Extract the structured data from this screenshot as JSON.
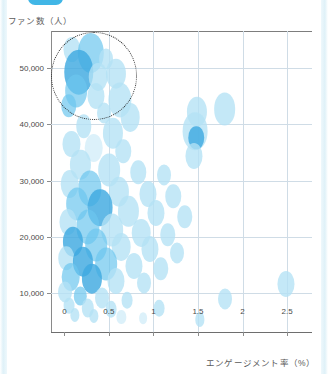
{
  "page": {
    "background_color": "#ffffff",
    "edge_strip_color": "#dff1f8"
  },
  "top_badge": {
    "name": "tab-pill",
    "color": "#41b6e6"
  },
  "chart_data": {
    "type": "scatter",
    "title": "",
    "xlabel": "エンゲージメント率（%）",
    "ylabel": "ファン数（人）",
    "xlim": [
      -0.15,
      2.78
    ],
    "ylim": [
      3000,
      56500
    ],
    "xticks": [
      0,
      0.5,
      1,
      1.5,
      2,
      2.5
    ],
    "xticklabels": [
      "0",
      "0.5",
      "1",
      "1.5",
      "2",
      "2.5"
    ],
    "yticks": [
      10000,
      20000,
      30000,
      40000,
      50000
    ],
    "yticklabels": [
      "10,000",
      "20,000",
      "30,000",
      "40,000",
      "50,000"
    ],
    "grid": true,
    "legend": "none",
    "marker_shape": "vertical-ellipse",
    "colors": {
      "bubble_dark": "#3fa9e0",
      "bubble_mid": "#6cc6ee",
      "bubble_light": "#b3e2f5",
      "bubble_pale": "#d6eef9",
      "grid": "#cfdce6",
      "axis": "#8c8c8c",
      "annotation": "#2b2b2b"
    },
    "annotations": [
      {
        "type": "dotted-ellipse",
        "label": "top-left cluster highlight",
        "center_x": 0.33,
        "center_y": 48500,
        "width_x": 0.96,
        "height_y": 15500
      }
    ],
    "points": [
      {
        "x": 0.09,
        "y": 53200,
        "r": 11,
        "shade": "light"
      },
      {
        "x": 0.3,
        "y": 52600,
        "r": 17,
        "shade": "mid"
      },
      {
        "x": 0.47,
        "y": 51600,
        "r": 9,
        "shade": "light"
      },
      {
        "x": 0.16,
        "y": 49200,
        "r": 19,
        "shade": "dark"
      },
      {
        "x": 0.38,
        "y": 48400,
        "r": 12,
        "shade": "light"
      },
      {
        "x": 0.58,
        "y": 48900,
        "r": 13,
        "shade": "light"
      },
      {
        "x": 0.13,
        "y": 45800,
        "r": 14,
        "shade": "mid"
      },
      {
        "x": 0.35,
        "y": 45000,
        "r": 11,
        "shade": "light"
      },
      {
        "x": 0.62,
        "y": 44300,
        "r": 15,
        "shade": "light"
      },
      {
        "x": 0.05,
        "y": 43300,
        "r": 10,
        "shade": "mid"
      },
      {
        "x": 0.45,
        "y": 42000,
        "r": 9,
        "shade": "light"
      },
      {
        "x": 0.74,
        "y": 41200,
        "r": 12,
        "shade": "light"
      },
      {
        "x": 1.49,
        "y": 42200,
        "r": 13,
        "shade": "light"
      },
      {
        "x": 1.8,
        "y": 42600,
        "r": 14,
        "shade": "light"
      },
      {
        "x": 0.22,
        "y": 39600,
        "r": 10,
        "shade": "light"
      },
      {
        "x": 0.55,
        "y": 38400,
        "r": 13,
        "shade": "light"
      },
      {
        "x": 1.47,
        "y": 38800,
        "r": 16,
        "shade": "light"
      },
      {
        "x": 1.48,
        "y": 37600,
        "r": 10,
        "shade": "dark"
      },
      {
        "x": 0.08,
        "y": 36400,
        "r": 11,
        "shade": "light"
      },
      {
        "x": 0.33,
        "y": 35800,
        "r": 12,
        "shade": "pale"
      },
      {
        "x": 0.66,
        "y": 35200,
        "r": 10,
        "shade": "light"
      },
      {
        "x": 1.46,
        "y": 34400,
        "r": 11,
        "shade": "light"
      },
      {
        "x": 0.18,
        "y": 32800,
        "r": 13,
        "shade": "light"
      },
      {
        "x": 0.5,
        "y": 31800,
        "r": 14,
        "shade": "light"
      },
      {
        "x": 0.83,
        "y": 31500,
        "r": 10,
        "shade": "light"
      },
      {
        "x": 1.12,
        "y": 31000,
        "r": 9,
        "shade": "light"
      },
      {
        "x": 0.06,
        "y": 29400,
        "r": 12,
        "shade": "light"
      },
      {
        "x": 0.29,
        "y": 28600,
        "r": 15,
        "shade": "mid"
      },
      {
        "x": 0.61,
        "y": 28000,
        "r": 13,
        "shade": "light"
      },
      {
        "x": 0.94,
        "y": 27600,
        "r": 11,
        "shade": "light"
      },
      {
        "x": 1.22,
        "y": 27200,
        "r": 10,
        "shade": "light"
      },
      {
        "x": 0.14,
        "y": 25800,
        "r": 14,
        "shade": "mid"
      },
      {
        "x": 0.4,
        "y": 25200,
        "r": 16,
        "shade": "dark"
      },
      {
        "x": 0.72,
        "y": 24600,
        "r": 13,
        "shade": "light"
      },
      {
        "x": 1.03,
        "y": 24200,
        "r": 11,
        "shade": "light"
      },
      {
        "x": 1.35,
        "y": 23600,
        "r": 10,
        "shade": "light"
      },
      {
        "x": 0.04,
        "y": 22600,
        "r": 11,
        "shade": "light"
      },
      {
        "x": 0.26,
        "y": 21800,
        "r": 15,
        "shade": "mid"
      },
      {
        "x": 0.54,
        "y": 21200,
        "r": 14,
        "shade": "light"
      },
      {
        "x": 0.86,
        "y": 20800,
        "r": 12,
        "shade": "light"
      },
      {
        "x": 1.16,
        "y": 20400,
        "r": 10,
        "shade": "light"
      },
      {
        "x": 0.1,
        "y": 19200,
        "r": 13,
        "shade": "dark"
      },
      {
        "x": 0.36,
        "y": 18600,
        "r": 14,
        "shade": "mid"
      },
      {
        "x": 0.64,
        "y": 18200,
        "r": 12,
        "shade": "light"
      },
      {
        "x": 0.96,
        "y": 17800,
        "r": 11,
        "shade": "light"
      },
      {
        "x": 1.26,
        "y": 17200,
        "r": 9,
        "shade": "light"
      },
      {
        "x": 0.02,
        "y": 16200,
        "r": 10,
        "shade": "light"
      },
      {
        "x": 0.21,
        "y": 15600,
        "r": 13,
        "shade": "dark"
      },
      {
        "x": 0.47,
        "y": 15200,
        "r": 14,
        "shade": "mid"
      },
      {
        "x": 0.78,
        "y": 14800,
        "r": 11,
        "shade": "light"
      },
      {
        "x": 1.08,
        "y": 14400,
        "r": 10,
        "shade": "light"
      },
      {
        "x": 0.07,
        "y": 13000,
        "r": 12,
        "shade": "mid"
      },
      {
        "x": 0.31,
        "y": 12600,
        "r": 13,
        "shade": "dark"
      },
      {
        "x": 0.58,
        "y": 12200,
        "r": 11,
        "shade": "light"
      },
      {
        "x": 0.89,
        "y": 11800,
        "r": 9,
        "shade": "light"
      },
      {
        "x": 2.49,
        "y": 11600,
        "r": 11,
        "shade": "light"
      },
      {
        "x": 0.01,
        "y": 10200,
        "r": 9,
        "shade": "light"
      },
      {
        "x": 0.18,
        "y": 9600,
        "r": 8,
        "shade": "mid"
      },
      {
        "x": 0.42,
        "y": 9200,
        "r": 9,
        "shade": "light"
      },
      {
        "x": 0.7,
        "y": 8800,
        "r": 7,
        "shade": "light"
      },
      {
        "x": 1.8,
        "y": 9000,
        "r": 9,
        "shade": "light"
      },
      {
        "x": 0.05,
        "y": 7800,
        "r": 7,
        "shade": "light"
      },
      {
        "x": 0.26,
        "y": 7400,
        "r": 8,
        "shade": "light"
      },
      {
        "x": 0.52,
        "y": 7200,
        "r": 7,
        "shade": "light"
      },
      {
        "x": 1.06,
        "y": 7400,
        "r": 7,
        "shade": "light"
      },
      {
        "x": 0.12,
        "y": 6200,
        "r": 6,
        "shade": "light"
      },
      {
        "x": 0.33,
        "y": 6000,
        "r": 6,
        "shade": "light"
      },
      {
        "x": 0.64,
        "y": 5800,
        "r": 6,
        "shade": "pale"
      },
      {
        "x": 0.88,
        "y": 5600,
        "r": 5,
        "shade": "pale"
      },
      {
        "x": 1.52,
        "y": 5400,
        "r": 6,
        "shade": "light"
      }
    ]
  }
}
